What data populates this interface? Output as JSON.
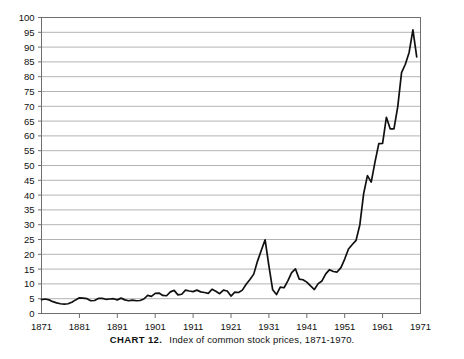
{
  "caption": {
    "chart_label": "CHART 12.",
    "text": "Index of common stock prices, 1871-1970."
  },
  "colors": {
    "line": "#101010",
    "grid": "#b4b4b4",
    "frame": "#6f6f6f",
    "text": "#111111",
    "background": "#ffffff"
  },
  "chart_data": {
    "type": "line",
    "title": "Index of common stock prices, 1871-1970.",
    "xlabel": "",
    "ylabel": "",
    "xlim": [
      1871,
      1971
    ],
    "ylim": [
      0,
      100
    ],
    "grid": true,
    "legend": false,
    "xticks": [
      1871,
      1881,
      1891,
      1901,
      1911,
      1921,
      1931,
      1941,
      1951,
      1961,
      1971
    ],
    "yticks": [
      0,
      5,
      10,
      15,
      20,
      25,
      30,
      35,
      40,
      45,
      50,
      55,
      60,
      65,
      70,
      75,
      80,
      85,
      90,
      95,
      100
    ],
    "xtick_labels": [
      "1871",
      "1881",
      "1891",
      "1901",
      "1911",
      "1921",
      "1931",
      "1941",
      "1951",
      "1961",
      "1971"
    ],
    "ytick_labels": [
      "0",
      "5",
      "10",
      "15",
      "20",
      "25",
      "30",
      "35",
      "40",
      "45",
      "50",
      "55",
      "60",
      "65",
      "70",
      "75",
      "80",
      "85",
      "90",
      "95",
      "100"
    ],
    "series": [
      {
        "name": "Index of common stock prices",
        "x": [
          1871,
          1872,
          1873,
          1874,
          1875,
          1876,
          1877,
          1878,
          1879,
          1880,
          1881,
          1882,
          1883,
          1884,
          1885,
          1886,
          1887,
          1888,
          1889,
          1890,
          1891,
          1892,
          1893,
          1894,
          1895,
          1896,
          1897,
          1898,
          1899,
          1900,
          1901,
          1902,
          1903,
          1904,
          1905,
          1906,
          1907,
          1908,
          1909,
          1910,
          1911,
          1912,
          1913,
          1914,
          1915,
          1916,
          1917,
          1918,
          1919,
          1920,
          1921,
          1922,
          1923,
          1924,
          1925,
          1926,
          1927,
          1928,
          1929,
          1930,
          1931,
          1932,
          1933,
          1934,
          1935,
          1936,
          1937,
          1938,
          1939,
          1940,
          1941,
          1942,
          1943,
          1944,
          1945,
          1946,
          1947,
          1948,
          1949,
          1950,
          1951,
          1952,
          1953,
          1954,
          1955,
          1956,
          1957,
          1958,
          1959,
          1960,
          1961,
          1962,
          1963,
          1964,
          1965,
          1966,
          1967,
          1968,
          1969,
          1970
        ],
        "y": [
          4.7,
          4.9,
          4.6,
          4.0,
          3.6,
          3.3,
          3.2,
          3.3,
          3.8,
          4.6,
          5.3,
          5.2,
          5.0,
          4.3,
          4.4,
          5.1,
          5.1,
          4.8,
          4.9,
          5.0,
          4.6,
          5.2,
          4.6,
          4.3,
          4.5,
          4.3,
          4.4,
          4.9,
          6.1,
          5.8,
          6.8,
          6.9,
          6.1,
          6.0,
          7.3,
          7.8,
          6.3,
          6.5,
          7.9,
          7.6,
          7.4,
          7.9,
          7.3,
          7.1,
          6.8,
          8.2,
          7.5,
          6.7,
          7.9,
          7.6,
          5.9,
          7.2,
          7.1,
          7.9,
          9.9,
          11.5,
          13.3,
          17.7,
          21.4,
          24.9,
          16.1,
          8.0,
          6.4,
          8.9,
          8.7,
          11.0,
          13.8,
          15.1,
          11.6,
          11.4,
          10.6,
          9.3,
          8.1,
          10.1,
          11.0,
          13.4,
          14.8,
          14.2,
          14.0,
          15.5,
          18.4,
          21.8,
          23.3,
          24.7,
          30.0,
          40.5,
          46.6,
          44.4,
          51.2,
          57.4,
          57.5,
          66.3,
          62.4,
          62.4,
          69.9,
          81.4,
          84.2,
          88.2,
          95.8,
          86.7
        ],
        "annotations": [
          {
            "x": 1929,
            "y": 24.9,
            "note": "1929 peak"
          },
          {
            "x": 1932,
            "y": 6.4,
            "note": "Depression trough"
          },
          {
            "x": 1968,
            "y": 95.8,
            "note": "1968 peak"
          }
        ]
      }
    ]
  }
}
